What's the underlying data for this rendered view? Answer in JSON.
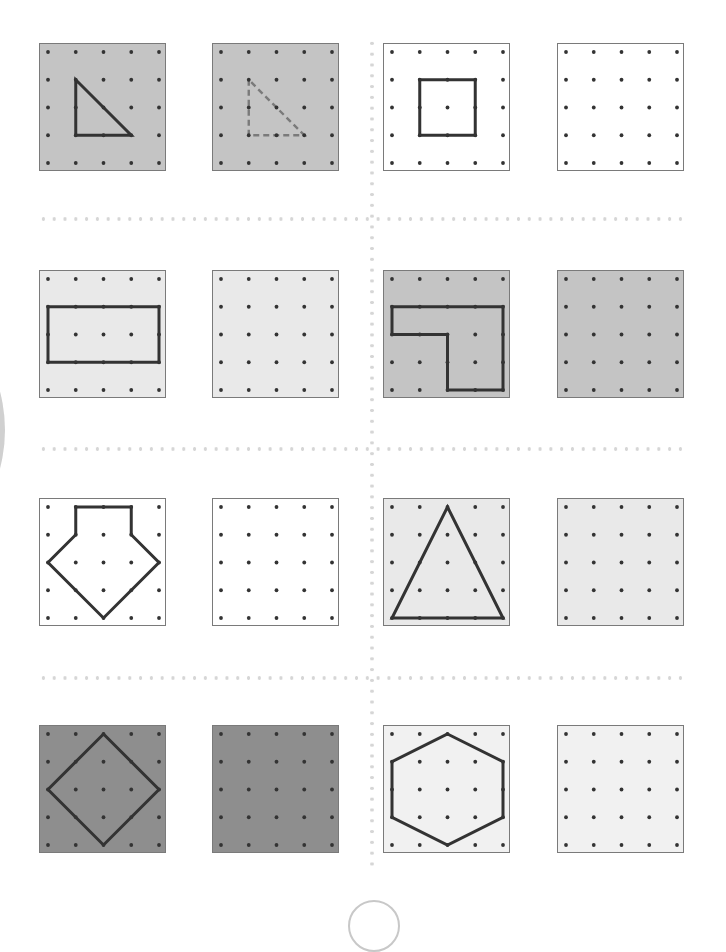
{
  "page": {
    "page_number": ""
  },
  "colors": {
    "mid_grey": "#c4c4c4",
    "light_grey": "#e9e9e9",
    "white": "#ffffff",
    "dark_grey": "#8e8e8e",
    "very_light": "#f1f1f1",
    "shape_stroke": "#333333",
    "dashed_stroke": "#7a7a7a",
    "dot": "#333333"
  },
  "grid": {
    "dots_per_side": 5
  },
  "rows": [
    {
      "boards": [
        {
          "name": "board-r1-c1",
          "fill": "#c4c4c4",
          "shape": {
            "type": "triangle",
            "points": [
              [
                1,
                1
              ],
              [
                1,
                3
              ],
              [
                3,
                3
              ]
            ],
            "style": "solid"
          }
        },
        {
          "name": "board-r1-c2",
          "fill": "#c4c4c4",
          "shape": {
            "type": "triangle",
            "points": [
              [
                1,
                1
              ],
              [
                1,
                3
              ],
              [
                3,
                3
              ]
            ],
            "style": "dashed"
          }
        },
        {
          "name": "board-r1-c3",
          "fill": "#ffffff",
          "shape": {
            "type": "square",
            "points": [
              [
                1,
                1
              ],
              [
                3,
                1
              ],
              [
                3,
                3
              ],
              [
                1,
                3
              ]
            ],
            "style": "solid"
          }
        },
        {
          "name": "board-r1-c4",
          "fill": "#ffffff",
          "shape": null
        }
      ]
    },
    {
      "boards": [
        {
          "name": "board-r2-c1",
          "fill": "#e9e9e9",
          "shape": {
            "type": "rectangle",
            "points": [
              [
                0,
                1
              ],
              [
                4,
                1
              ],
              [
                4,
                3
              ],
              [
                0,
                3
              ]
            ],
            "style": "solid"
          }
        },
        {
          "name": "board-r2-c2",
          "fill": "#e9e9e9",
          "shape": null
        },
        {
          "name": "board-r2-c3",
          "fill": "#c4c4c4",
          "shape": {
            "type": "l-shape",
            "points": [
              [
                0,
                1
              ],
              [
                4,
                1
              ],
              [
                4,
                4
              ],
              [
                2,
                4
              ],
              [
                2,
                2
              ],
              [
                0,
                2
              ]
            ],
            "style": "solid"
          }
        },
        {
          "name": "board-r2-c4",
          "fill": "#c4c4c4",
          "shape": null
        }
      ]
    },
    {
      "boards": [
        {
          "name": "board-r3-c1",
          "fill": "#ffffff",
          "shape": {
            "type": "house-pentagon",
            "points": [
              [
                1,
                0
              ],
              [
                3,
                0
              ],
              [
                3,
                1
              ],
              [
                4,
                2
              ],
              [
                2,
                4
              ],
              [
                0,
                2
              ],
              [
                1,
                1
              ]
            ],
            "style": "solid"
          }
        },
        {
          "name": "board-r3-c2",
          "fill": "#ffffff",
          "shape": null
        },
        {
          "name": "board-r3-c3",
          "fill": "#e9e9e9",
          "shape": {
            "type": "triangle",
            "points": [
              [
                2,
                0
              ],
              [
                4,
                4
              ],
              [
                0,
                4
              ]
            ],
            "style": "solid"
          }
        },
        {
          "name": "board-r3-c4",
          "fill": "#e9e9e9",
          "shape": null
        }
      ]
    },
    {
      "boards": [
        {
          "name": "board-r4-c1",
          "fill": "#8e8e8e",
          "shape": {
            "type": "diamond",
            "points": [
              [
                2,
                0
              ],
              [
                4,
                2
              ],
              [
                2,
                4
              ],
              [
                0,
                2
              ]
            ],
            "style": "solid"
          }
        },
        {
          "name": "board-r4-c2",
          "fill": "#8e8e8e",
          "shape": null
        },
        {
          "name": "board-r4-c3",
          "fill": "#f1f1f1",
          "shape": {
            "type": "hexagon",
            "points": [
              [
                2,
                0
              ],
              [
                4,
                1
              ],
              [
                4,
                3
              ],
              [
                2,
                4
              ],
              [
                0,
                3
              ],
              [
                0,
                1
              ]
            ],
            "style": "solid"
          }
        },
        {
          "name": "board-r4-c4",
          "fill": "#f1f1f1",
          "shape": null
        }
      ]
    }
  ]
}
